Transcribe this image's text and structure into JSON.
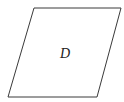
{
  "diagram": {
    "shape": "parallelogram",
    "region_label": "D",
    "stroke_color": "#3a3a3a",
    "fill_color": "#ffffff",
    "vertices": [
      [
        34,
        8
      ],
      [
        121,
        8
      ],
      [
        97,
        97
      ],
      [
        8,
        97
      ]
    ]
  }
}
